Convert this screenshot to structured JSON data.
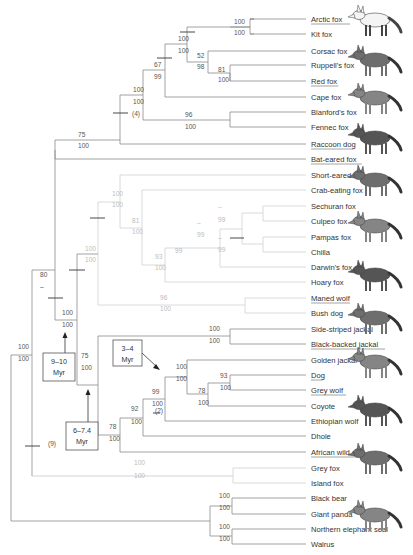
{
  "figure": {
    "type": "phylogenetic-tree"
  },
  "taxa": [
    {
      "name": "Arctic fox",
      "y": 19,
      "underline": true,
      "faint": false
    },
    {
      "name": "Kit fox",
      "y": 34,
      "underline": false,
      "faint": false
    },
    {
      "name": "Corsac fox",
      "y": 51,
      "underline": false,
      "faint": false
    },
    {
      "name": "Ruppell's fox",
      "y": 65,
      "underline": false,
      "faint": false
    },
    {
      "name": "Red fox",
      "y": 81,
      "underline": true,
      "faint": false
    },
    {
      "name": "Cape fox",
      "y": 97,
      "underline": false,
      "faint": false
    },
    {
      "name": "Blanford's fox",
      "y": 112,
      "underline": false,
      "faint": false
    },
    {
      "name": "Fennec fox",
      "y": 127,
      "underline": false,
      "faint": false
    },
    {
      "name": "Raccoon dog",
      "y": 144,
      "underline": true,
      "faint": false
    },
    {
      "name": "Bat-eared fox",
      "y": 159,
      "underline": true,
      "faint": false
    },
    {
      "name": "Short-eared fox",
      "y": 175,
      "underline": false,
      "faint": true
    },
    {
      "name": "Crab-eating fox",
      "y": 190,
      "underline": false,
      "faint": true
    },
    {
      "name": "Sechuran fox",
      "y": 206,
      "underline": false,
      "faint": true
    },
    {
      "name": "Culpeo fox",
      "y": 221,
      "underline": false,
      "faint": true
    },
    {
      "name": "Pampas fox",
      "y": 237,
      "underline": false,
      "faint": true
    },
    {
      "name": "Chilla",
      "y": 252,
      "underline": false,
      "faint": true
    },
    {
      "name": "Darwin's fox",
      "y": 267,
      "underline": false,
      "faint": true
    },
    {
      "name": "Hoary fox",
      "y": 282,
      "underline": false,
      "faint": true
    },
    {
      "name": "Maned wolf",
      "y": 298,
      "underline": true,
      "faint": true
    },
    {
      "name": "Bush dog",
      "y": 313,
      "underline": false,
      "faint": true
    },
    {
      "name": "Side-striped jackal",
      "y": 329,
      "underline": false,
      "faint": false
    },
    {
      "name": "Black-backed jackal",
      "y": 344,
      "underline": true,
      "faint": false
    },
    {
      "name": "Golden jackal",
      "y": 360,
      "underline": false,
      "faint": false
    },
    {
      "name": "Dog",
      "y": 375,
      "underline": true,
      "faint": false
    },
    {
      "name": "Grey wolf",
      "y": 390,
      "underline": true,
      "faint": false
    },
    {
      "name": "Coyote",
      "y": 406,
      "underline": false,
      "faint": false
    },
    {
      "name": "Ethiopian wolf",
      "y": 421,
      "underline": false,
      "faint": false
    },
    {
      "name": "Dhole",
      "y": 436,
      "underline": false,
      "faint": false
    },
    {
      "name": "African wild dog",
      "y": 452,
      "underline": true,
      "faint": false
    },
    {
      "name": "Grey fox",
      "y": 468,
      "underline": false,
      "faint": false
    },
    {
      "name": "Island fox",
      "y": 483,
      "underline": false,
      "faint": false
    },
    {
      "name": "Black bear",
      "y": 498,
      "underline": false,
      "faint": false
    },
    {
      "name": "Giant panda",
      "y": 514,
      "underline": false,
      "faint": false
    },
    {
      "name": "Northern elephant seal",
      "y": 529,
      "underline": false,
      "faint": false
    },
    {
      "name": "Walrus",
      "y": 544,
      "underline": false,
      "faint": false
    }
  ],
  "support_labels": [
    {
      "x": 234,
      "y": 24,
      "text": "100",
      "faint": false
    },
    {
      "x": 234,
      "y": 35,
      "text": "100",
      "faint": false
    },
    {
      "x": 178,
      "y": 41,
      "text": "100",
      "faint": false
    },
    {
      "x": 178,
      "y": 53,
      "text": "100",
      "faint": false
    },
    {
      "x": 197,
      "y": 58,
      "text": "52",
      "faint": false
    },
    {
      "x": 197,
      "y": 69,
      "text": "98",
      "faint": false
    },
    {
      "x": 218,
      "y": 72,
      "text": "81",
      "faint": false
    },
    {
      "x": 218,
      "y": 82,
      "text": "100",
      "faint": false
    },
    {
      "x": 154,
      "y": 67,
      "text": "67",
      "faint": false
    },
    {
      "x": 154,
      "y": 79,
      "text": "99",
      "faint": false
    },
    {
      "x": 133,
      "y": 92,
      "text": "100",
      "faint": false
    },
    {
      "x": 133,
      "y": 104,
      "text": "100",
      "faint": false
    },
    {
      "x": 132,
      "y": 116,
      "text": "(4)",
      "faint": false
    },
    {
      "x": 185,
      "y": 117,
      "text": "96",
      "faint": false
    },
    {
      "x": 185,
      "y": 129,
      "text": "100",
      "faint": false
    },
    {
      "x": 78,
      "y": 137,
      "text": "75",
      "faint": false
    },
    {
      "x": 78,
      "y": 148,
      "text": "100",
      "faint": false
    },
    {
      "x": 112,
      "y": 196,
      "text": "100",
      "faint": true
    },
    {
      "x": 112,
      "y": 207,
      "text": "100",
      "faint": true
    },
    {
      "x": 132,
      "y": 223,
      "text": "81",
      "faint": true
    },
    {
      "x": 132,
      "y": 234,
      "text": "100",
      "faint": true
    },
    {
      "x": 218,
      "y": 209,
      "text": "–",
      "faint": true
    },
    {
      "x": 218,
      "y": 222,
      "text": "99",
      "faint": true
    },
    {
      "x": 197,
      "y": 225,
      "text": "–",
      "faint": true
    },
    {
      "x": 197,
      "y": 237,
      "text": "99",
      "faint": true
    },
    {
      "x": 218,
      "y": 240,
      "text": "–",
      "faint": true
    },
    {
      "x": 218,
      "y": 252,
      "text": "99",
      "faint": true
    },
    {
      "x": 175,
      "y": 253,
      "text": "99",
      "faint": true
    },
    {
      "x": 155,
      "y": 259,
      "text": "93",
      "faint": true
    },
    {
      "x": 155,
      "y": 270,
      "text": "100",
      "faint": true
    },
    {
      "x": 85,
      "y": 251,
      "text": "100",
      "faint": true
    },
    {
      "x": 85,
      "y": 262,
      "text": "100",
      "faint": true
    },
    {
      "x": 160,
      "y": 300,
      "text": "96",
      "faint": true
    },
    {
      "x": 160,
      "y": 311,
      "text": "100",
      "faint": true
    },
    {
      "x": 40,
      "y": 277,
      "text": "80",
      "faint": false
    },
    {
      "x": 40,
      "y": 289,
      "text": "–",
      "faint": false
    },
    {
      "x": 62,
      "y": 315,
      "text": "100",
      "faint": false
    },
    {
      "x": 62,
      "y": 327,
      "text": "100",
      "faint": false
    },
    {
      "x": 18,
      "y": 349,
      "text": "100",
      "faint": false
    },
    {
      "x": 18,
      "y": 361,
      "text": "100",
      "faint": false
    },
    {
      "x": 81,
      "y": 358,
      "text": "75",
      "faint": false
    },
    {
      "x": 81,
      "y": 370,
      "text": "100",
      "faint": false
    },
    {
      "x": 209,
      "y": 331,
      "text": "100",
      "faint": false
    },
    {
      "x": 209,
      "y": 343,
      "text": "100",
      "faint": false
    },
    {
      "x": 176,
      "y": 369,
      "text": "100",
      "faint": false
    },
    {
      "x": 176,
      "y": 381,
      "text": "100",
      "faint": false
    },
    {
      "x": 220,
      "y": 378,
      "text": "93",
      "faint": false
    },
    {
      "x": 220,
      "y": 390,
      "text": "100",
      "faint": false
    },
    {
      "x": 198,
      "y": 393,
      "text": "78",
      "faint": false
    },
    {
      "x": 198,
      "y": 405,
      "text": "100",
      "faint": false
    },
    {
      "x": 152,
      "y": 394,
      "text": "99",
      "faint": false
    },
    {
      "x": 152,
      "y": 406,
      "text": "100",
      "faint": false
    },
    {
      "x": 155,
      "y": 413,
      "text": "(2)",
      "faint": false
    },
    {
      "x": 131,
      "y": 411,
      "text": "92",
      "faint": false
    },
    {
      "x": 131,
      "y": 424,
      "text": "100",
      "faint": false
    },
    {
      "x": 109,
      "y": 429,
      "text": "78",
      "faint": false
    },
    {
      "x": 109,
      "y": 441,
      "text": "100",
      "faint": false
    },
    {
      "x": 48,
      "y": 446,
      "text": "(9)",
      "faint": false
    },
    {
      "x": 134,
      "y": 465,
      "text": "100",
      "faint": true
    },
    {
      "x": 134,
      "y": 478,
      "text": "100",
      "faint": true
    },
    {
      "x": 219,
      "y": 498,
      "text": "100",
      "faint": false
    },
    {
      "x": 219,
      "y": 510,
      "text": "100",
      "faint": false
    },
    {
      "x": 219,
      "y": 529,
      "text": "100",
      "faint": false
    },
    {
      "x": 219,
      "y": 541,
      "text": "100",
      "faint": false
    }
  ],
  "date_boxes": [
    {
      "id": "box-9-10",
      "line1": "9–10",
      "line2": "Myr",
      "x": 43,
      "y": 353,
      "w": 32,
      "h": 28
    },
    {
      "id": "box-6-7.4",
      "line1": "6–7.4",
      "line2": "Myr",
      "x": 66,
      "y": 422,
      "w": 32,
      "h": 28
    },
    {
      "id": "box-3-4",
      "line1": "3–4",
      "line2": "Myr",
      "x": 113,
      "y": 340,
      "w": 29,
      "h": 26
    }
  ],
  "animal_illustrations": [
    {
      "name": "arctic-fox-illustration",
      "y": 20
    },
    {
      "name": "red-fox-illustration",
      "y": 60
    },
    {
      "name": "raccoon-dog-illustration",
      "y": 98
    },
    {
      "name": "bat-eared-fox-illustration",
      "y": 138
    },
    {
      "name": "crab-eating-fox-illustration",
      "y": 180
    },
    {
      "name": "maned-wolf-illustration",
      "y": 226
    },
    {
      "name": "bush-dog-illustration",
      "y": 275
    },
    {
      "name": "black-backed-jackal-illustration",
      "y": 318
    },
    {
      "name": "dog-illustration",
      "y": 362
    },
    {
      "name": "grey-wolf-illustration",
      "y": 410
    },
    {
      "name": "african-wild-dog-illustration",
      "y": 458
    },
    {
      "name": "grey-fox-illustration",
      "y": 515
    }
  ],
  "colors": {
    "branch": "#8a8a8a",
    "branch_faint": "#d0d0d0",
    "text": "#333333",
    "support_faint": "#bdbdbd"
  }
}
